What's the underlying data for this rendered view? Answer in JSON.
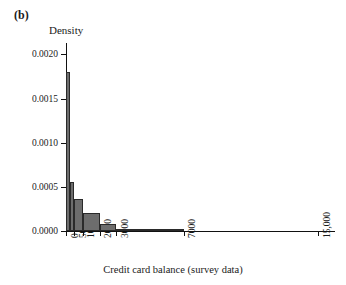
{
  "panel": {
    "label": "(b)"
  },
  "axes": {
    "ylabel": "Density",
    "xlabel": "Credit card balance (survey data)"
  },
  "chart_data": {
    "type": "bar",
    "title": "(b)",
    "subtitle": "",
    "xlabel": "Credit card balance (survey data)",
    "ylabel": "Density",
    "xlim": [
      0,
      16000
    ],
    "ylim": [
      0.0,
      0.00213
    ],
    "grid": false,
    "legend": null,
    "xtick_labels": [
      "0",
      "500",
      "1000",
      "2000",
      "3000",
      "7000",
      "15,000"
    ],
    "xtick_values": [
      0,
      500,
      1000,
      2000,
      3000,
      7000,
      15000
    ],
    "ytick_labels": [
      "0.0000",
      "0.0005",
      "0.0010",
      "0.0015",
      "0.0020"
    ],
    "ytick_values": [
      0.0,
      0.0005,
      0.001,
      0.0015,
      0.002
    ],
    "bins": [
      {
        "x0": 0,
        "x1": 250,
        "density": 0.0018
      },
      {
        "x0": 250,
        "x1": 500,
        "density": 0.00055
      },
      {
        "x0": 500,
        "x1": 1000,
        "density": 0.00036
      },
      {
        "x0": 1000,
        "x1": 2000,
        "density": 0.0002
      },
      {
        "x0": 2000,
        "x1": 3000,
        "density": 8e-05
      },
      {
        "x0": 3000,
        "x1": 7000,
        "density": 2e-05
      }
    ],
    "categories": [
      "0-250",
      "250-500",
      "500-1000",
      "1000-2000",
      "2000-3000",
      "3000-7000"
    ],
    "values": [
      0.0018,
      0.00055,
      0.00036,
      0.0002,
      8e-05,
      2e-05
    ],
    "colors": {
      "bar_fill": "#6d6d6d",
      "bar_edge": "#2a2a2a",
      "axis": "#111111"
    }
  }
}
